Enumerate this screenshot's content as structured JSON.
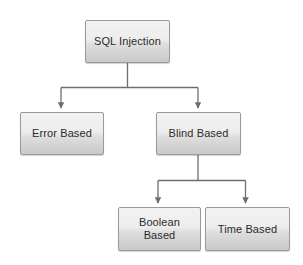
{
  "diagram": {
    "type": "tree-flowchart",
    "background_color": "#ffffff",
    "node_fill_top_color": "#f2f2f2",
    "node_fill_bottom_color": "#c9c9c9",
    "node_border_color": "#9a9a9a",
    "connector_color": "#6e6e6e",
    "text_color": "#2b2b2b",
    "nodes": [
      {
        "id": "sql-injection",
        "label": "SQL Injection",
        "level": 0
      },
      {
        "id": "error-based",
        "label": "Error Based",
        "level": 1
      },
      {
        "id": "blind-based",
        "label": "Blind Based",
        "level": 1
      },
      {
        "id": "boolean-based",
        "label": "Boolean\nBased",
        "level": 2
      },
      {
        "id": "time-based",
        "label": "Time Based",
        "level": 2
      }
    ],
    "edges": [
      {
        "from": "sql-injection",
        "to": "error-based"
      },
      {
        "from": "sql-injection",
        "to": "blind-based"
      },
      {
        "from": "blind-based",
        "to": "boolean-based"
      },
      {
        "from": "blind-based",
        "to": "time-based"
      }
    ]
  }
}
